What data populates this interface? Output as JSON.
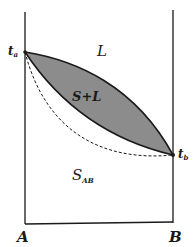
{
  "diagram": {
    "type": "binary phase diagram",
    "colors": {
      "line": "#1a1a1a",
      "two_phase_fill": "#8c8c8c",
      "background": "#ffffff"
    },
    "labels": {
      "ta": "t",
      "ta_sub": "a",
      "tb": "t",
      "tb_sub": "b",
      "liquid": "L",
      "two_phase": "S+L",
      "solid": "S",
      "solid_sub": "AB",
      "axis_left": "A",
      "axis_right": "B"
    },
    "regions": [
      "L",
      "S+L",
      "S_AB"
    ],
    "curves": {
      "liquidus": "solid upper curve from t_a to t_b",
      "solidus": "solid lower curve from t_a to t_b",
      "dashed": "dashed curve from t_a to t_b below the solidus"
    }
  }
}
